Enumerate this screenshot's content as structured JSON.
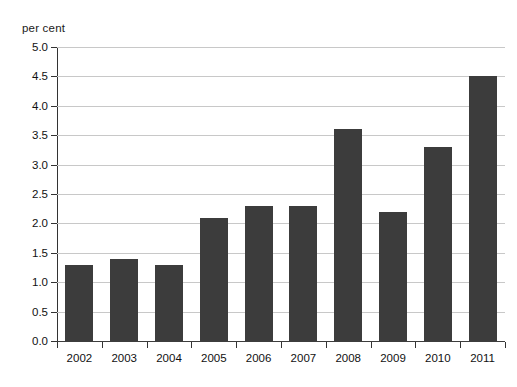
{
  "chart_data": {
    "type": "bar",
    "title": "",
    "subtitle": "",
    "xlabel": "",
    "ylabel": "per cent",
    "unit_label": "per cent",
    "categories": [
      "2002",
      "2003",
      "2004",
      "2005",
      "2006",
      "2007",
      "2008",
      "2009",
      "2010",
      "2011"
    ],
    "values": [
      1.3,
      1.4,
      1.3,
      2.1,
      2.3,
      2.3,
      3.6,
      2.2,
      3.3,
      4.5
    ],
    "series": [
      {
        "name": "per cent",
        "values": [
          1.3,
          1.4,
          1.3,
          2.1,
          2.3,
          2.3,
          3.6,
          2.2,
          3.3,
          4.5
        ]
      }
    ],
    "ylim": [
      0.0,
      5.0
    ],
    "ytick_step": 0.5,
    "ytick_labels": [
      "0.0",
      "0.5",
      "1.0",
      "1.5",
      "2.0",
      "2.5",
      "3.0",
      "3.5",
      "4.0",
      "4.5",
      "5.0"
    ],
    "ytick_values": [
      0.0,
      0.5,
      1.0,
      1.5,
      2.0,
      2.5,
      3.0,
      3.5,
      4.0,
      4.5,
      5.0
    ],
    "grid": true,
    "grid_axis": "y",
    "legend": false,
    "legend_position": "none",
    "annotations": [],
    "colors": {
      "bar": "#3c3c3c",
      "gridline": "#c8c8c8",
      "axis": "#333333",
      "baseline": "#3d3d3d",
      "background": "#ffffff",
      "text": "#111111"
    }
  }
}
